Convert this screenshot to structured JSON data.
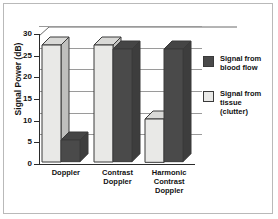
{
  "chart_data": {
    "type": "bar",
    "title": "",
    "xlabel": "",
    "ylabel": "Signal Power (dB)",
    "ylim": [
      0,
      30
    ],
    "yticks": [
      0,
      5,
      10,
      15,
      20,
      25,
      30
    ],
    "ytick_labels": [
      "0",
      "5",
      "10",
      "15",
      "20",
      "25",
      "30"
    ],
    "grid": true,
    "legend_position": "right",
    "style": "3d-bar",
    "categories": [
      "Doppler",
      "Contrast Doppler",
      "Harmonic Contrast Doppler"
    ],
    "category_lines": [
      [
        "Doppler"
      ],
      [
        "Contrast",
        "Doppler"
      ],
      [
        "Harmonic",
        "Contrast",
        "Doppler"
      ]
    ],
    "series": [
      {
        "name": "Signal from tissue (clutter)",
        "name_lines": [
          "Signal from",
          "tissue",
          "(clutter)"
        ],
        "color": "#e9e9e7",
        "values": [
          27,
          27,
          10
        ]
      },
      {
        "name": "Signal from blood flow",
        "name_lines": [
          "Signal from",
          "blood flow"
        ],
        "color": "#4a4a4a",
        "values": [
          5,
          26,
          26
        ]
      }
    ]
  },
  "legend": {
    "items": [
      {
        "label_line1": "Signal from",
        "label_line2": "blood flow",
        "label_line3": "",
        "color": "#4a4a4a"
      },
      {
        "label_line1": "Signal from",
        "label_line2": "tissue",
        "label_line3": "(clutter)",
        "color": "#e9e9e7"
      }
    ]
  },
  "axis": {
    "y_title": "Signal Power (dB)",
    "y_tick_0": "0",
    "y_tick_1": "5",
    "y_tick_2": "10",
    "y_tick_3": "15",
    "y_tick_4": "20",
    "y_tick_5": "25",
    "y_tick_6": "30"
  },
  "categories": {
    "c0_l0": "Doppler",
    "c1_l0": "Contrast",
    "c1_l1": "Doppler",
    "c2_l0": "Harmonic",
    "c2_l1": "Contrast",
    "c2_l2": "Doppler"
  },
  "colors": {
    "tissue": "#e9e9e7",
    "blood": "#4a4a4a",
    "grid": "#9a9a9a",
    "axis": "#2a2a2a",
    "frame": "#b9b9b9",
    "background": "#ffffff"
  }
}
